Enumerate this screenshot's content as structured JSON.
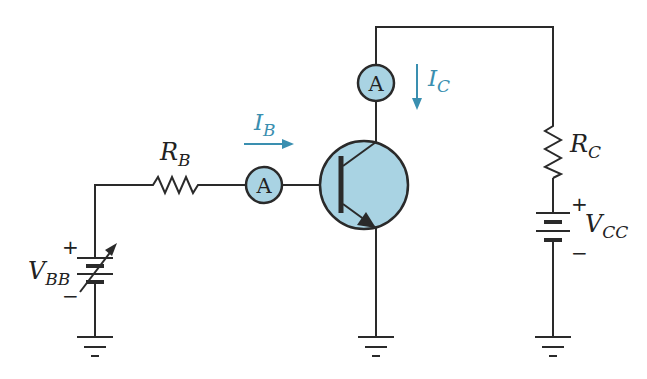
{
  "diagram": {
    "type": "transistor-bias-circuit",
    "colors": {
      "wire": "#2a2a2a",
      "meter_fill": "#a9d3e3",
      "current_arrow": "#3a8fb0",
      "text": "#222222"
    },
    "components": {
      "rb": {
        "main": "R",
        "sub": "B"
      },
      "rc": {
        "main": "R",
        "sub": "C"
      },
      "vbb": {
        "main": "V",
        "sub": "BB",
        "plus": "+",
        "minus": "−"
      },
      "vcc": {
        "main": "V",
        "sub": "CC",
        "plus": "+",
        "minus": "−"
      },
      "ammeter_base": {
        "symbol": "A"
      },
      "ammeter_collector": {
        "symbol": "A"
      },
      "transistor": {
        "kind": "NPN"
      }
    },
    "currents": {
      "ib": {
        "main": "I",
        "sub": "B",
        "direction": "right"
      },
      "ic": {
        "main": "I",
        "sub": "C",
        "direction": "down"
      }
    },
    "grounds": [
      "ground-vbb",
      "ground-emitter",
      "ground-vcc"
    ]
  }
}
